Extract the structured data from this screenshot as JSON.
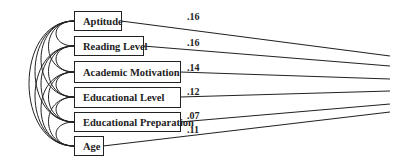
{
  "diagram": {
    "type": "path diagram",
    "variables": [
      {
        "label": "Aptitude",
        "coefficient": ".16"
      },
      {
        "label": "Reading Level",
        "coefficient": ".16"
      },
      {
        "label": "Academic Motivation",
        "coefficient": ".14"
      },
      {
        "label": "Educational Level",
        "coefficient": ".12"
      },
      {
        "label": "Educational Preparation",
        "coefficient": ".07"
      },
      {
        "label": "Age",
        "coefficient": ".11"
      }
    ],
    "colors": {
      "line": "#222222",
      "background": "#ffffff"
    }
  }
}
